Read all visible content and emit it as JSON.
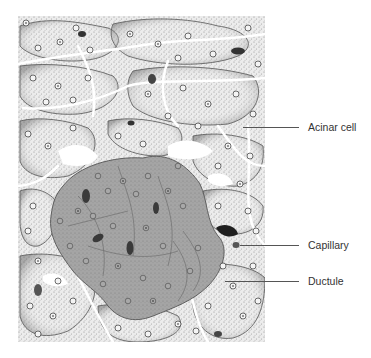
{
  "figure": {
    "colors": {
      "background": "#ffffff",
      "acinar_fill": "#e6e6e6",
      "stipple": "#8a8a8a",
      "islet_fill": "#a3a3a3",
      "nucleus_stroke": "#333333",
      "capillary_fill": "#3a3a3a",
      "leader_line": "#555555",
      "label_text": "#333333"
    }
  },
  "labels": [
    {
      "text": "Acinar cell"
    },
    {
      "text": "Capillary"
    },
    {
      "text": "Ductule"
    }
  ]
}
